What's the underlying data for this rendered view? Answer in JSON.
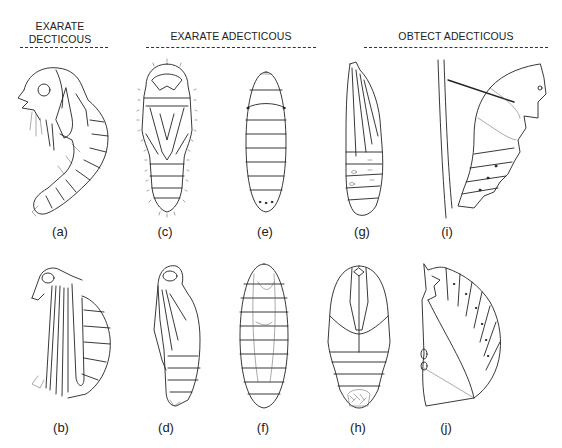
{
  "figure": {
    "groups": [
      {
        "title_line1": "EXARATE",
        "title_line2": "DECTICOUS"
      },
      {
        "title_line1": "EXARATE ADECTICOUS"
      },
      {
        "title_line1": "OBTECT ADECTICOUS"
      }
    ],
    "panels": [
      {
        "id": "a",
        "label": "(a)",
        "group": "EXARATE DECTICOUS",
        "view": "lateral, curved pupa"
      },
      {
        "id": "b",
        "label": "(b)",
        "group": "EXARATE DECTICOUS",
        "view": "lateral, long appendages"
      },
      {
        "id": "c",
        "label": "(c)",
        "group": "EXARATE ADECTICOUS",
        "view": "ventral, setose pupa"
      },
      {
        "id": "d",
        "label": "(d)",
        "group": "EXARATE ADECTICOUS",
        "view": "lateral pupa"
      },
      {
        "id": "e",
        "label": "(e)",
        "group": "EXARATE ADECTICOUS",
        "view": "puparium, dorsal"
      },
      {
        "id": "f",
        "label": "(f)",
        "group": "EXARATE ADECTICOUS",
        "view": "puparium with pupa visible"
      },
      {
        "id": "g",
        "label": "(g)",
        "group": "OBTECT ADECTICOUS",
        "view": "lateral obtect pupa"
      },
      {
        "id": "h",
        "label": "(h)",
        "group": "OBTECT ADECTICOUS",
        "view": "ventral obtect pupa"
      },
      {
        "id": "i",
        "label": "(i)",
        "group": "OBTECT ADECTICOUS",
        "view": "chrysalis with silk girdle on stem"
      },
      {
        "id": "j",
        "label": "(j)",
        "group": "OBTECT ADECTICOUS",
        "view": "lateral obtect pupa, curved"
      }
    ]
  }
}
